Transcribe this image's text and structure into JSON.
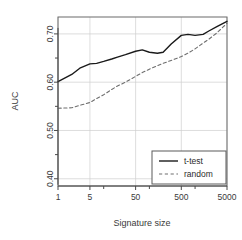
{
  "chart_data": {
    "type": "line",
    "title": "",
    "xlabel": "Signature size",
    "ylabel": "AUC",
    "xscale": "log",
    "xlim": [
      1,
      5000
    ],
    "ylim": [
      0.385,
      0.735
    ],
    "grid": true,
    "legend_position": "bottom-right",
    "y_ticks_major": [
      0.4,
      0.5,
      0.6,
      0.7
    ],
    "y_tick_labels": [
      "0.40",
      "0.50",
      "0.60",
      "0.70"
    ],
    "y_ticks_minor": [
      0.45,
      0.55,
      0.65
    ],
    "x_ticks_major": [
      1,
      5,
      50,
      500,
      5000
    ],
    "x_tick_labels": [
      "1",
      "5",
      "50",
      "500",
      "5000"
    ],
    "x_ticks_minor": [
      10,
      100,
      1000
    ],
    "x": [
      1,
      2,
      3,
      5,
      7,
      10,
      15,
      20,
      30,
      50,
      70,
      100,
      150,
      200,
      300,
      500,
      700,
      1000,
      1500,
      2000,
      3000,
      5000
    ],
    "series": [
      {
        "name": "t-test",
        "style": "solid",
        "color": "#1a1a1a",
        "values": [
          0.601,
          0.616,
          0.629,
          0.638,
          0.639,
          0.643,
          0.648,
          0.652,
          0.657,
          0.664,
          0.667,
          0.662,
          0.66,
          0.662,
          0.679,
          0.697,
          0.699,
          0.697,
          0.699,
          0.706,
          0.715,
          0.726
        ]
      },
      {
        "name": "random",
        "style": "dashed",
        "color": "#6e6e6e",
        "values": [
          0.546,
          0.547,
          0.552,
          0.558,
          0.566,
          0.574,
          0.585,
          0.592,
          0.6,
          0.612,
          0.62,
          0.627,
          0.634,
          0.639,
          0.645,
          0.653,
          0.66,
          0.669,
          0.681,
          0.689,
          0.702,
          0.722
        ]
      }
    ],
    "legend": [
      {
        "label": "t-test",
        "style": "solid",
        "color": "#1a1a1a"
      },
      {
        "label": "random",
        "style": "dashed",
        "color": "#6e6e6e"
      }
    ]
  }
}
